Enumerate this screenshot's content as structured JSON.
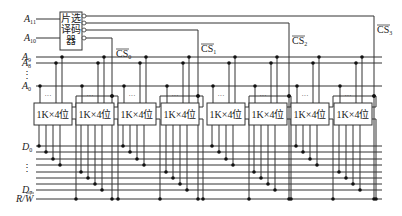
{
  "decoder": {
    "label_lines": [
      "片选",
      "译码",
      "器"
    ],
    "inputs": [
      {
        "name": "A",
        "sub": "11",
        "y": 19
      },
      {
        "name": "A",
        "sub": "10",
        "y": 38
      }
    ],
    "outputs": [
      {
        "label": "CS",
        "sub": "3",
        "y": 16,
        "x_end": 374,
        "label_x": 377,
        "label_y": 33
      },
      {
        "label": "CS",
        "sub": "2",
        "y": 23,
        "x_end": 289,
        "label_x": 292,
        "label_y": 44
      },
      {
        "label": "CS",
        "sub": "1",
        "y": 30,
        "x_end": 198,
        "label_x": 201,
        "label_y": 52
      },
      {
        "label": "CS",
        "sub": "0",
        "y": 38,
        "x_end": 112,
        "label_x": 116,
        "label_y": 57
      }
    ]
  },
  "address_bus": {
    "labels": [
      {
        "name": "A",
        "sub": "9",
        "y": 57
      },
      {
        "name": "A",
        "sub": "8",
        "y": 63
      },
      {
        "name": "⋮",
        "sub": "",
        "y": 75
      },
      {
        "name": "A",
        "sub": "0",
        "y": 86
      }
    ],
    "ellipsis": "···"
  },
  "chips": [
    {
      "label": "1K×4位",
      "x": 34,
      "group": 0,
      "half": 0
    },
    {
      "label": "1K×4位",
      "x": 76,
      "group": 0,
      "half": 1
    },
    {
      "label": "1K×4位",
      "x": 118,
      "group": 1,
      "half": 0
    },
    {
      "label": "1K×4位",
      "x": 161,
      "group": 1,
      "half": 1
    },
    {
      "label": "1K×4位",
      "x": 207,
      "group": 2,
      "half": 0
    },
    {
      "label": "1K×4位",
      "x": 249,
      "group": 2,
      "half": 1
    },
    {
      "label": "1K×4位",
      "x": 291,
      "group": 3,
      "half": 0
    },
    {
      "label": "1K×4位",
      "x": 334,
      "group": 3,
      "half": 1
    }
  ],
  "data_bus": {
    "labels": [
      {
        "name": "D",
        "sub": "0",
        "y": 147
      },
      {
        "name": "⋮",
        "sub": "",
        "y": 168
      },
      {
        "name": "D",
        "sub": "7",
        "y": 190
      }
    ],
    "line_ys": [
      146,
      152,
      159,
      165,
      172,
      178,
      184,
      190
    ],
    "rw_label": "R/W",
    "rw_y": 199
  }
}
